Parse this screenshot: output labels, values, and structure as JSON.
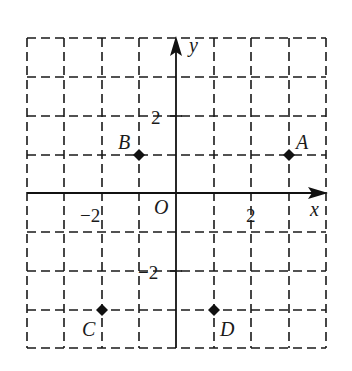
{
  "diagram": {
    "type": "coordinate-plane",
    "grid": {
      "x_range": [
        -4,
        4
      ],
      "y_range": [
        -4,
        4
      ],
      "step": 1,
      "style": "dashed"
    },
    "axes": {
      "x_label": "x",
      "y_label": "y",
      "origin_label": "O"
    },
    "tick_labels": {
      "x_neg2": "−2",
      "x_pos2": "2",
      "y_pos2": "2",
      "y_neg2": "−2"
    },
    "points": [
      {
        "label": "A",
        "x": 3,
        "y": 1
      },
      {
        "label": "B",
        "x": -1,
        "y": 1
      },
      {
        "label": "C",
        "x": -2,
        "y": -3
      },
      {
        "label": "D",
        "x": 1,
        "y": -3
      }
    ],
    "colors": {
      "ink": "#1a1a1a",
      "background": "#ffffff"
    }
  }
}
